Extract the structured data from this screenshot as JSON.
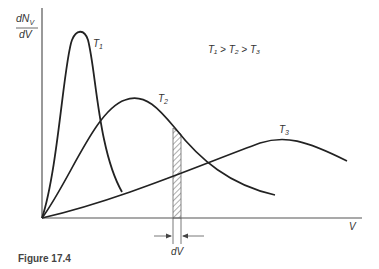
{
  "figure": {
    "caption": "Figure 17.4",
    "y_axis_label_top": "dN",
    "y_axis_label_sub": "V",
    "y_axis_label_bottom": "dV",
    "x_axis_label": "V",
    "relation": "T₁ > T₂ > T₃",
    "interval_label": "dV",
    "curves": [
      {
        "name": "T",
        "sub": "1"
      },
      {
        "name": "T",
        "sub": "2"
      },
      {
        "name": "T",
        "sub": "3"
      }
    ]
  }
}
